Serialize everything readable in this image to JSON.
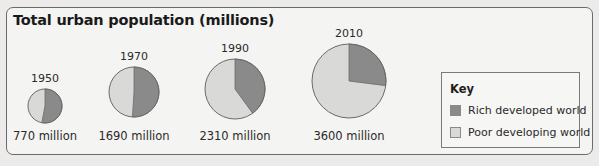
{
  "title": "Total urban population (millions)",
  "colors": {
    "rich": "#8a8a8a",
    "poor": "#d9d9d7",
    "outline": "#6a6a6a"
  },
  "pies": [
    {
      "year": "1950",
      "total_label": "770 million",
      "cx": 45,
      "cy": 106,
      "r": 17,
      "rich_share": 0.53
    },
    {
      "year": "1970",
      "total_label": "1690 million",
      "cx": 134,
      "cy": 92,
      "r": 25,
      "rich_share": 0.51
    },
    {
      "year": "1990",
      "total_label": "2310 million",
      "cx": 235,
      "cy": 89,
      "r": 30,
      "rich_share": 0.4
    },
    {
      "year": "2010",
      "total_label": "3600 million",
      "cx": 349,
      "cy": 81,
      "r": 37,
      "rich_share": 0.27
    }
  ],
  "legend": {
    "title": "Key",
    "items": [
      {
        "label": "Rich developed world",
        "series": "rich"
      },
      {
        "label": "Poor developing world",
        "series": "poor"
      }
    ]
  },
  "chart_data": {
    "type": "pie",
    "title": "Total urban population (millions)",
    "categories": [
      "1950",
      "1970",
      "1990",
      "2010"
    ],
    "totals_millions": [
      770,
      1690,
      2310,
      3600
    ],
    "total_labels": [
      "770 million",
      "1690 million",
      "2310 million",
      "3600 million"
    ],
    "series": [
      {
        "name": "Rich developed world",
        "share_percent": [
          53,
          51,
          40,
          27
        ]
      },
      {
        "name": "Poor developing world",
        "share_percent": [
          47,
          49,
          60,
          73
        ]
      }
    ],
    "legend_title": "Key",
    "legend_position": "right"
  }
}
